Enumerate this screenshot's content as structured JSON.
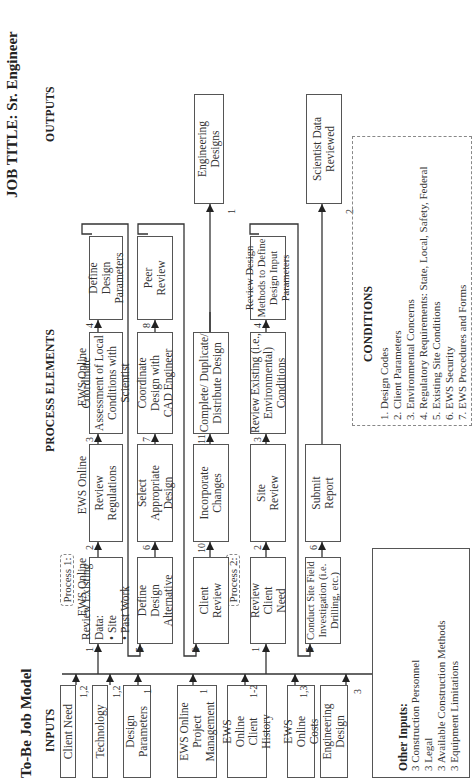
{
  "header": {
    "model_title": "To-Be Job Model",
    "job_title": "JOB TITLE: Sr. Engineer"
  },
  "sections": {
    "inputs": "INPUTS",
    "process_elements": "PROCESS ELEMENTS",
    "outputs": "OUTPUTS",
    "conditions": "CONDITIONS"
  },
  "inputs": [
    {
      "label": "Client Need",
      "refs": "1,2"
    },
    {
      "label": "Technology",
      "refs": "1,2"
    },
    {
      "label": "Design Parameters",
      "refs": "1"
    },
    {
      "label": "EWS Online Project Management",
      "refs": "1"
    },
    {
      "label": "EWS Online Client History",
      "refs": "1-2"
    },
    {
      "label": "EWS Online Costs",
      "refs": "1,3"
    },
    {
      "label": "Engineering Design",
      "refs": "3"
    }
  ],
  "other_inputs": {
    "title": "Other Inputs:",
    "items": [
      "3 Construction Personnel",
      "3 Legal",
      "3 Available Construction Methods",
      "3 Equipment Limitations"
    ]
  },
  "processes": [
    {
      "label": "Process 1:",
      "rows": [
        [
          {
            "num": "1",
            "tag": "EWS Online",
            "text": "Review Existing Data:",
            "bullets": [
              "Site",
              "Past Work"
            ]
          },
          {
            "num": "2",
            "tag": "EWS Online",
            "text": "Review Regulations"
          },
          {
            "num": "3",
            "tag": "EWS Online",
            "text": "Coordinate Assessment of Local Conditions with Scientist"
          },
          {
            "num": "4",
            "text": "Define Design Parameters"
          }
        ],
        [
          {
            "num": "5",
            "text": "Define Design Alternative"
          },
          {
            "num": "6",
            "text": "Select Appropriate Design"
          },
          {
            "num": "7",
            "text": "Coordinate Design with CAD Engineer"
          },
          {
            "num": "8",
            "text": "Peer Review"
          }
        ],
        [
          {
            "num": "9",
            "text": "Client Review"
          },
          {
            "num": "10",
            "text": "Incorporate Changes"
          },
          {
            "num": "11",
            "text": "Complete/ Duplicate/ Distribute Design"
          }
        ]
      ]
    },
    {
      "label": "Process 2:",
      "rows": [
        [
          {
            "num": "1",
            "text": "Review Client Need"
          },
          {
            "num": "2",
            "text": "Site Review"
          },
          {
            "num": "3",
            "text": "Review Existing (i.e., Environmental) Conditions"
          },
          {
            "num": "4",
            "text": "Review Design Methods to Define Design Input Parameters"
          }
        ],
        [
          {
            "num": "5",
            "text": "Conduct Site Field Investigation (i.e. Drilling, etc.)"
          },
          {
            "num": "6",
            "text": "Submit Report"
          }
        ]
      ]
    }
  ],
  "outputs": [
    {
      "num": "1",
      "label": "Engineering Designs"
    },
    {
      "num": "2",
      "label": "Scientist Data Reviewed"
    }
  ],
  "conditions": [
    "1. Design Codes",
    "2. Client Parameters",
    "3. Environmental Concerns",
    "4. Regulatory Requirements: State, Local, Safety, Federal",
    "5. Existing Site Conditions",
    "6. EWS Security",
    "7. EWS Procedures and Forms"
  ]
}
